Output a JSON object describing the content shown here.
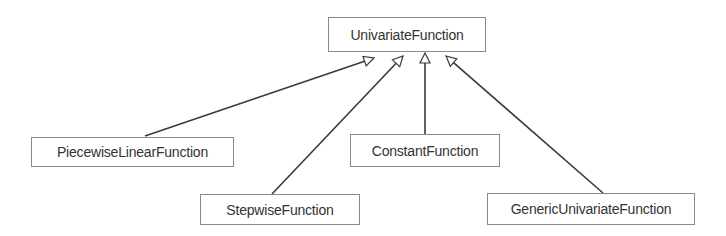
{
  "diagram": {
    "type": "uml-class-hierarchy",
    "colors": {
      "line": "#3a3a3a",
      "box_border": "#8a8a8a",
      "text": "#333333",
      "background": "#ffffff"
    },
    "nodes": [
      {
        "id": "univariate",
        "label": "UnivariateFunction",
        "x": 328,
        "y": 17,
        "w": 158,
        "h": 35
      },
      {
        "id": "piecewise",
        "label": "PiecewiseLinearFunction",
        "x": 31,
        "y": 137,
        "w": 203,
        "h": 30
      },
      {
        "id": "constant",
        "label": "ConstantFunction",
        "x": 350,
        "y": 134,
        "w": 150,
        "h": 33
      },
      {
        "id": "stepwise",
        "label": "StepwiseFunction",
        "x": 200,
        "y": 194,
        "w": 160,
        "h": 31
      },
      {
        "id": "generic",
        "label": "GenericUnivariateFunction",
        "x": 487,
        "y": 193,
        "w": 208,
        "h": 32
      }
    ],
    "edges": [
      {
        "from": "piecewise",
        "to": "univariate",
        "kind": "generalization",
        "tail": [
          145,
          136
        ],
        "tip": [
          374,
          58
        ]
      },
      {
        "from": "stepwise",
        "to": "univariate",
        "kind": "generalization",
        "tail": [
          272,
          194
        ],
        "tip": [
          403,
          56
        ]
      },
      {
        "from": "constant",
        "to": "univariate",
        "kind": "generalization",
        "tail": [
          425,
          134
        ],
        "tip": [
          425,
          53
        ]
      },
      {
        "from": "generic",
        "to": "univariate",
        "kind": "generalization",
        "tail": [
          603,
          193
        ],
        "tip": [
          446,
          56
        ]
      }
    ]
  }
}
